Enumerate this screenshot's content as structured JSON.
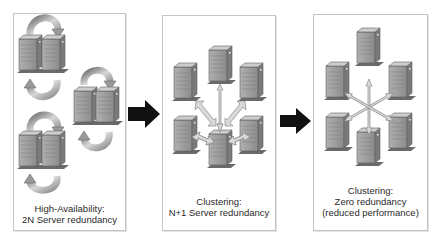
{
  "diagram": {
    "panels": [
      {
        "id": "high-availability",
        "caption": [
          "High-Availability:",
          "2N Server redundancy"
        ],
        "server_count": 6,
        "topology": "three mirrored pairs with circular failover arrows"
      },
      {
        "id": "clustering-n-plus-1",
        "caption": [
          "Clustering:",
          "N+1 Server redundancy"
        ],
        "server_count": 6,
        "topology": "five servers linked by two-headed arrows to one standby server"
      },
      {
        "id": "clustering-zero",
        "caption": [
          "Clustering:",
          "Zero redundancy",
          "(reduced performance)"
        ],
        "server_count": 6,
        "topology": "six servers linked via central six-way star arrow"
      }
    ],
    "transitions": [
      {
        "from": "high-availability",
        "to": "clustering-n-plus-1",
        "icon": "right-arrow-icon"
      },
      {
        "from": "clustering-n-plus-1",
        "to": "clustering-zero",
        "icon": "right-arrow-icon"
      }
    ],
    "colors": {
      "panel_border": "#c4c4c4",
      "server_front": "#9a9a9a",
      "server_side": "#7d7d7d",
      "server_top": "#c8c8c8",
      "arrow_fill": "#d9d9d9",
      "arrow_stroke": "#8a8a8a",
      "transition_arrow": "#111111",
      "text": "#2a2a2a"
    }
  }
}
